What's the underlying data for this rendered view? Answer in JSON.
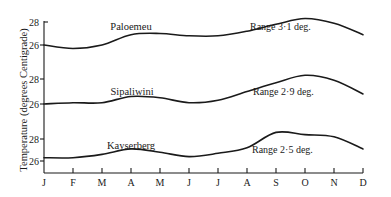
{
  "chart_data": {
    "type": "line",
    "title": "",
    "ylabel": "Temperature (degrees Centigrade)",
    "xlabel": "",
    "categories": [
      "J",
      "F",
      "M",
      "A",
      "M",
      "J",
      "J",
      "A",
      "S",
      "O",
      "N",
      "D"
    ],
    "grid": false,
    "legend": "none (labels placed on curves)",
    "panels": [
      {
        "name": "Paloemeu",
        "range_label": "Range 3·1 deg.",
        "yticks": [
          26,
          28
        ],
        "values": [
          26.0,
          25.7,
          26.0,
          26.9,
          27.0,
          26.8,
          26.8,
          27.2,
          27.8,
          28.3,
          27.9,
          26.9
        ]
      },
      {
        "name": "Sipaliwini",
        "range_label": "Range 2·9 deg.",
        "yticks": [
          26,
          28
        ],
        "values": [
          26.0,
          26.1,
          26.1,
          26.6,
          26.5,
          26.1,
          26.3,
          27.0,
          27.7,
          28.3,
          27.9,
          26.8
        ]
      },
      {
        "name": "Kayserberg",
        "range_label": "Range 2·5 deg.",
        "yticks": [
          26,
          28
        ],
        "values": [
          26.3,
          26.3,
          26.6,
          27.1,
          26.8,
          26.4,
          26.7,
          27.2,
          28.6,
          28.4,
          28.2,
          27.1
        ]
      }
    ]
  },
  "labels": {
    "ylabel": "Temperature (degrees Centigrade)",
    "tick28": "28",
    "tick26": "26",
    "months": [
      "J",
      "F",
      "M",
      "A",
      "M",
      "J",
      "J",
      "A",
      "S",
      "O",
      "N",
      "D"
    ],
    "stations": [
      "Paloemeu",
      "Sipaliwini",
      "Kayserberg"
    ],
    "ranges": [
      "Range 3·1 deg.",
      "Range 2·9 deg.",
      "Range 2·5 deg."
    ]
  }
}
